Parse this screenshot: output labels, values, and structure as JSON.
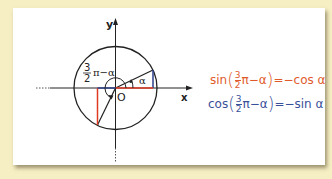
{
  "diagram": {
    "axes": {
      "x_label": "x",
      "y_label": "y",
      "origin_label": "O"
    },
    "angle_labels": {
      "alpha": "α",
      "big_angle_num": "3",
      "big_angle_den": "2",
      "big_angle_rest": "π−α"
    },
    "colors": {
      "sin": "#e05a2b",
      "cos": "#3a4f9a",
      "red_segment": "#e03a22",
      "blue_segment": "#2d3f8c",
      "background": "#f7efc4"
    }
  },
  "formulas": [
    {
      "func": "sin",
      "num": "3",
      "den": "2",
      "arg_rest": "π−α",
      "rhs": "=−cos α",
      "color": "#e05a2b"
    },
    {
      "func": "cos",
      "num": "3",
      "den": "2",
      "arg_rest": "π−α",
      "rhs": "=−sin α",
      "color": "#3a4f9a"
    }
  ]
}
